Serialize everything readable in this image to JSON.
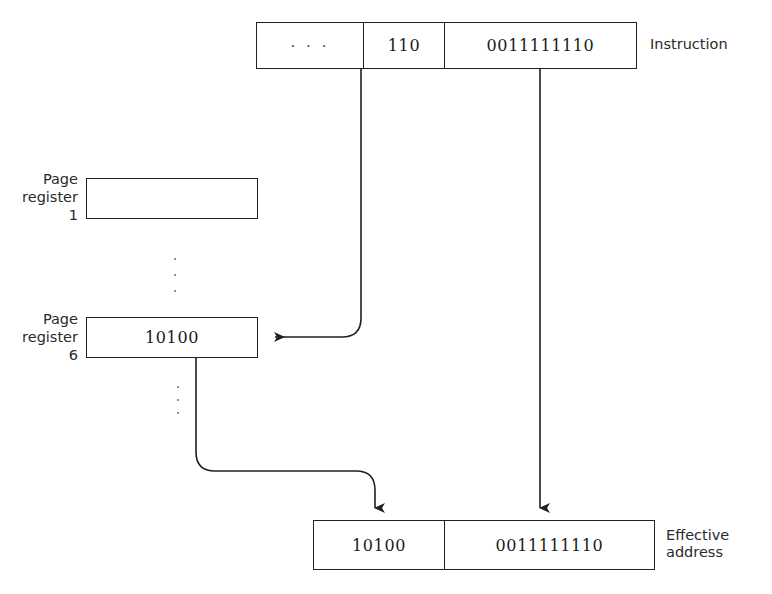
{
  "diagram": {
    "instruction": {
      "label": "Instruction",
      "fields": [
        {
          "name": "opcode-field",
          "value": "· · ·"
        },
        {
          "name": "page-field",
          "value": "110"
        },
        {
          "name": "displacement-field",
          "value": "0011111110"
        }
      ]
    },
    "page_registers": [
      {
        "label": "Page\nregister\n1",
        "value": ""
      },
      {
        "label": "Page\nregister\n6",
        "value": "10100"
      }
    ],
    "ellipsis": {
      "upper": "⋮",
      "lower": "⋮"
    },
    "effective_address": {
      "label": "Effective\naddress",
      "fields": [
        {
          "name": "page-frame-field",
          "value": "10100"
        },
        {
          "name": "displacement-field",
          "value": "0011111110"
        }
      ]
    },
    "colors": {
      "stroke": "#231f20",
      "background": "#ffffff",
      "text": "#1a1a1a",
      "label_text": "#2b2b2b",
      "dot": "#6b6b6b"
    }
  }
}
